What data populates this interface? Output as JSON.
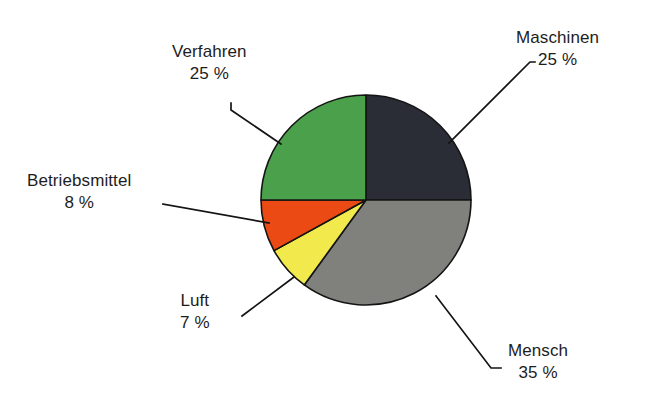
{
  "chart_data": {
    "type": "pie",
    "title": "",
    "subtitle": "",
    "xlabel": "",
    "ylabel": "",
    "legend_position": "none",
    "grid": false,
    "labels_outside": true,
    "unit": "%",
    "categories": [
      "Maschinen",
      "Mensch",
      "Luft",
      "Betriebsmittel",
      "Verfahren"
    ],
    "values": [
      25,
      35,
      7,
      8,
      25
    ],
    "total": 100,
    "slices": [
      {
        "label": "Maschinen",
        "value": 25,
        "value_text": "25 %",
        "color": "#2a2d36",
        "start_angle_deg": 0,
        "end_angle_deg": 90
      },
      {
        "label": "Mensch",
        "value": 35,
        "value_text": "35 %",
        "color": "#80807d",
        "start_angle_deg": 90,
        "end_angle_deg": 216
      },
      {
        "label": "Luft",
        "value": 7,
        "value_text": "7 %",
        "color": "#f2ea4c",
        "start_angle_deg": 216,
        "end_angle_deg": 241.2
      },
      {
        "label": "Betriebsmittel",
        "value": 8,
        "value_text": "8 %",
        "color": "#ec4a14",
        "start_angle_deg": 241.2,
        "end_angle_deg": 270
      },
      {
        "label": "Verfahren",
        "value": 25,
        "value_text": "25 %",
        "color": "#4ba14b",
        "start_angle_deg": 270,
        "end_angle_deg": 360
      }
    ],
    "colors": {
      "maschinen": "#2a2d36",
      "mensch": "#80807d",
      "luft": "#f2ea4c",
      "betriebsmittel": "#ec4a14",
      "verfahren": "#4ba14b",
      "outline": "#141414",
      "leader_line": "#141414",
      "text": "#1d1d1d",
      "background": "#ffffff"
    }
  },
  "labels": {
    "maschinen": {
      "name": "Maschinen",
      "value": "25 %"
    },
    "verfahren": {
      "name": "Verfahren",
      "value": "25 %"
    },
    "betriebsmittel": {
      "name": "Betriebsmittel",
      "value": "8 %"
    },
    "luft": {
      "name": "Luft",
      "value": "7 %"
    },
    "mensch": {
      "name": "Mensch",
      "value": "35 %"
    }
  }
}
